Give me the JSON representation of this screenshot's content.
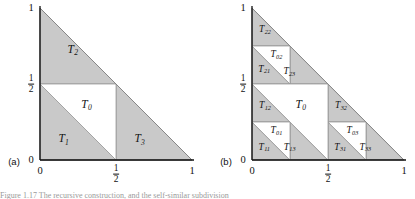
{
  "figure": {
    "background_color": "#ffffff",
    "shade_color": "#c9c9c9",
    "shade_stroke": "#8f8f8f",
    "axis_color": "#111111",
    "white_color": "#ffffff"
  },
  "panels": [
    {
      "tag": "(a)",
      "origin_x": 40,
      "origin_y": 160,
      "size": 152,
      "axis_ticks": {
        "y_top": "1",
        "y_mid_num": "1",
        "y_mid_den": "2",
        "y_zero": "0",
        "x_zero": "0",
        "x_mid_num": "1",
        "x_mid_den": "2",
        "x_one": "1"
      },
      "regions": [
        {
          "name": "T2",
          "base": "T",
          "sub": "2",
          "cx": 0.215,
          "cy": 0.725,
          "size": "big"
        },
        {
          "name": "T0",
          "base": "T",
          "sub": "0",
          "cx": 0.305,
          "cy": 0.365,
          "size": "big"
        },
        {
          "name": "T1",
          "base": "T",
          "sub": "1",
          "cx": 0.155,
          "cy": 0.135,
          "size": "big"
        },
        {
          "name": "T3",
          "base": "T",
          "sub": "3",
          "cx": 0.655,
          "cy": 0.135,
          "size": "big"
        }
      ]
    },
    {
      "tag": "(b)",
      "origin_x": 252,
      "origin_y": 160,
      "size": 152,
      "axis_ticks": {
        "y_top": "1",
        "y_mid_num": "1",
        "y_mid_den": "2",
        "y_zero": "0",
        "x_zero": "0",
        "x_mid_num": "1",
        "x_mid_den": "2",
        "x_one": "1"
      },
      "regions": [
        {
          "name": "T22",
          "base": "T",
          "sub": "22",
          "cx": 0.085,
          "cy": 0.855,
          "size": "small"
        },
        {
          "name": "T02",
          "base": "T",
          "sub": "02",
          "cx": 0.16,
          "cy": 0.69,
          "size": "small"
        },
        {
          "name": "T21",
          "base": "T",
          "sub": "21",
          "cx": 0.08,
          "cy": 0.595,
          "size": "small"
        },
        {
          "name": "T23",
          "base": "T",
          "sub": "23",
          "cx": 0.245,
          "cy": 0.58,
          "size": "small"
        },
        {
          "name": "T12",
          "base": "T",
          "sub": "12",
          "cx": 0.085,
          "cy": 0.355,
          "size": "small"
        },
        {
          "name": "T0",
          "base": "T",
          "sub": "0",
          "cx": 0.32,
          "cy": 0.365,
          "size": "big"
        },
        {
          "name": "T32",
          "base": "T",
          "sub": "32",
          "cx": 0.585,
          "cy": 0.355,
          "size": "small"
        },
        {
          "name": "T01",
          "base": "T",
          "sub": "01",
          "cx": 0.16,
          "cy": 0.192,
          "size": "small"
        },
        {
          "name": "T03",
          "base": "T",
          "sub": "03",
          "cx": 0.66,
          "cy": 0.192,
          "size": "small"
        },
        {
          "name": "T11",
          "base": "T",
          "sub": "11",
          "cx": 0.08,
          "cy": 0.082,
          "size": "small"
        },
        {
          "name": "T13",
          "base": "T",
          "sub": "13",
          "cx": 0.247,
          "cy": 0.082,
          "size": "small"
        },
        {
          "name": "T31",
          "base": "T",
          "sub": "31",
          "cx": 0.58,
          "cy": 0.082,
          "size": "small"
        },
        {
          "name": "T33",
          "base": "T",
          "sub": "33",
          "cx": 0.745,
          "cy": 0.082,
          "size": "small"
        }
      ]
    }
  ],
  "caption": {
    "text": "Figure 1.17    The recursive construction, and the self-similar subdivision"
  }
}
